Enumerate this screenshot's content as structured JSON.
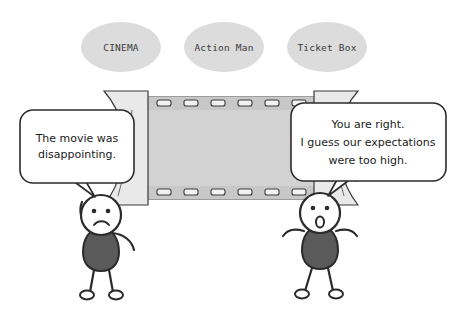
{
  "canvas": {
    "width": 462,
    "height": 312,
    "background": "#ffffff"
  },
  "palette": {
    "ellipse_fill": "#dcdcdc",
    "screen_fill": "#d2d2d2",
    "curtain_fill": "#e9e9e9",
    "torso_fill": "#5a5a5a",
    "outline": "#2b2b2b",
    "bubble_fill": "#ffffff",
    "text": "#1a1a1a",
    "tag_text": "#3a3a3a"
  },
  "tags": [
    {
      "id": "cinema",
      "label": "CINEMA",
      "cx": 121,
      "cy": 47,
      "rx": 40,
      "ry": 25
    },
    {
      "id": "action-man",
      "label": "Action Man",
      "cx": 224,
      "cy": 47,
      "rx": 40,
      "ry": 25
    },
    {
      "id": "ticket-box",
      "label": "Ticket Box",
      "cx": 327,
      "cy": 47,
      "rx": 40,
      "ry": 25
    }
  ],
  "screen": {
    "name": "film-strip-screen",
    "sprocket_count": 6,
    "top_band_y": 97,
    "bottom_band_y": 189
  },
  "curtains": {
    "left_name": "left-curtain",
    "right_name": "right-curtain"
  },
  "bubbles": [
    {
      "id": "left-bubble",
      "speaker": "left-character",
      "align": "center",
      "lines": [
        "The movie was",
        "disappointing."
      ],
      "x": 20,
      "y": 110,
      "w": 114,
      "h": 73
    },
    {
      "id": "right-bubble",
      "speaker": "right-character",
      "align": "center",
      "lines": [
        "You are right.",
        "I guess our expectations",
        "were too high."
      ],
      "x": 291,
      "y": 103,
      "w": 155,
      "h": 78
    }
  ],
  "characters": [
    {
      "id": "left-character",
      "mood": "sad",
      "mouth": "frown",
      "pose": "one-arm-raised",
      "head_cx": 101,
      "head_cy": 215,
      "head_r": 20
    },
    {
      "id": "right-character",
      "mood": "surprised",
      "mouth": "open-o",
      "pose": "arms-out",
      "head_cx": 320,
      "head_cy": 213,
      "head_r": 20
    }
  ]
}
